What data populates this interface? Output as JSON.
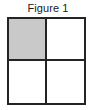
{
  "figure": {
    "caption": "Figure 1",
    "shape": "square",
    "grid": {
      "rows": 2,
      "columns": 2,
      "total_cells": 4,
      "shaded_cells": 1,
      "unshaded_cells": 3,
      "shaded_fraction": "1/4"
    },
    "colors": {
      "outline": "#242424",
      "shaded_fill": "#c9c9c9",
      "unshaded_fill": "#ffffff",
      "background": "#ffffff",
      "caption_text": "#1a1a1a"
    },
    "cells": [
      {
        "id": "top-left",
        "row": 1,
        "column": 1,
        "fill": "shaded",
        "fill_color": "#c9c9c9"
      },
      {
        "id": "top-right",
        "row": 1,
        "column": 2,
        "fill": "unshaded",
        "fill_color": "#ffffff"
      },
      {
        "id": "bottom-left",
        "row": 2,
        "column": 1,
        "fill": "unshaded",
        "fill_color": "#ffffff"
      },
      {
        "id": "bottom-right",
        "row": 2,
        "column": 2,
        "fill": "unshaded",
        "fill_color": "#ffffff"
      }
    ]
  }
}
